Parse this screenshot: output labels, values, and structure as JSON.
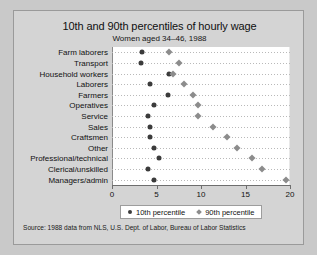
{
  "chart_data": {
    "type": "scatter",
    "title": "10th and 90th percentiles of hourly wage",
    "subtitle": "Women aged 34–46, 1988",
    "xlabel": "",
    "ylabel": "",
    "xlim": [
      0,
      20
    ],
    "xticks": [
      0,
      5,
      10,
      15,
      20
    ],
    "grid": "horizontal-dotted",
    "legend_position": "bottom",
    "categories": [
      "Farm laborers",
      "Transport",
      "Household workers",
      "Laborers",
      "Farmers",
      "Operatives",
      "Service",
      "Sales",
      "Craftsmen",
      "Other",
      "Professional/technical",
      "Clerical/unskilled",
      "Managers/admin"
    ],
    "series": [
      {
        "name": "10th percentile",
        "marker": "circle",
        "color": "#3b3b3b",
        "values": [
          3.4,
          3.3,
          6.4,
          4.3,
          6.3,
          4.7,
          4.1,
          4.3,
          4.3,
          4.7,
          5.3,
          4.0,
          4.7
        ]
      },
      {
        "name": "90th percentile",
        "marker": "diamond",
        "color": "#8c8c8c",
        "values": [
          6.4,
          7.5,
          6.8,
          8.1,
          9.1,
          9.7,
          9.7,
          11.3,
          12.9,
          14.1,
          15.7,
          16.8,
          19.6
        ]
      }
    ],
    "source": "Source:  1988 data from NLS, U.S. Dept. of Labor, Bureau of Labor Statistics"
  }
}
